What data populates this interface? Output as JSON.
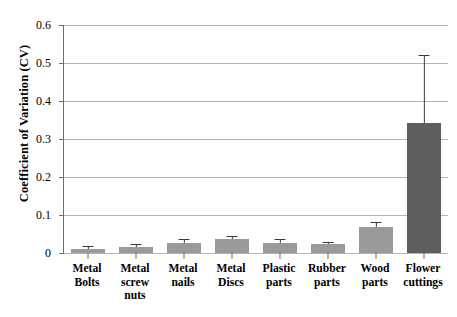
{
  "chart_data": {
    "type": "bar",
    "title": "",
    "xlabel": "",
    "ylabel": "Coefficient of Variation (CV)",
    "categories": [
      "Metal Bolts",
      "Metal screw nuts",
      "Metal nails",
      "Metal Discs",
      "Plastic parts",
      "Rubber parts",
      "Wood parts",
      "Flower cuttings"
    ],
    "category_lines": [
      [
        "Metal",
        "Bolts"
      ],
      [
        "Metal",
        "screw",
        "nuts"
      ],
      [
        "Metal",
        "nails"
      ],
      [
        "Metal",
        "Discs"
      ],
      [
        "Plastic",
        "parts"
      ],
      [
        "Rubber",
        "parts"
      ],
      [
        "Wood",
        "parts"
      ],
      [
        "Flower",
        "cuttings"
      ]
    ],
    "values": [
      0.011,
      0.015,
      0.027,
      0.037,
      0.026,
      0.025,
      0.068,
      0.342
    ],
    "errors": [
      0.008,
      0.008,
      0.011,
      0.009,
      0.012,
      0.005,
      0.014,
      0.178
    ],
    "bar_colors": [
      "#9a9a9a",
      "#9a9a9a",
      "#9a9a9a",
      "#9a9a9a",
      "#9a9a9a",
      "#9a9a9a",
      "#9a9a9a",
      "#5e5e5e"
    ],
    "ylim": [
      0,
      0.6
    ],
    "ytick_values": [
      0,
      0.1,
      0.2,
      0.3,
      0.4,
      0.5,
      0.6
    ],
    "ytick_labels": [
      "0",
      "0.1",
      "0.2",
      "0.3",
      "0.4",
      "0.5",
      "0.6"
    ],
    "grid": true,
    "legend": "none",
    "error_bar_style": "upper-only-cap"
  }
}
